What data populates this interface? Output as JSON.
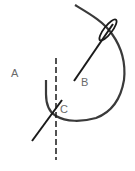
{
  "diagram": {
    "labels": {
      "a": "A",
      "b": "B",
      "c": "C"
    },
    "colors": {
      "stroke": "#1a1a1a",
      "curve": "#3a3a3a",
      "label": "#6a6a6a",
      "background": "#ffffff"
    }
  }
}
